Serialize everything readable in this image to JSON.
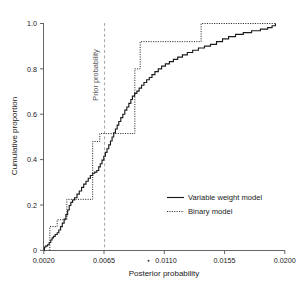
{
  "chart_data": {
    "type": "line",
    "title": "",
    "subtitle": "",
    "xlabel": "Posterior probability",
    "ylabel": "Cumulative proportion",
    "xlim": [
      0.002,
      0.02
    ],
    "ylim": [
      0.0,
      1.0
    ],
    "grid": false,
    "legend_position": "center-right",
    "xticks": [
      "0.0020",
      "0.0065",
      "0.0110",
      "0.0155",
      "0.0200"
    ],
    "xtick_values": [
      0.002,
      0.0065,
      0.011,
      0.0155,
      0.02
    ],
    "yticks": [
      "0",
      "0.2",
      "0.4",
      "0.6",
      "0.8",
      "1.0"
    ],
    "ytick_values": [
      0,
      0.2,
      0.4,
      0.6,
      0.8,
      1.0
    ],
    "annotations": [
      {
        "name": "prior-probability-line",
        "label": "Prior probability",
        "x": 0.00645,
        "orientation": "vertical",
        "style": "dashed",
        "color": "#9a9a9a"
      }
    ],
    "series": [
      {
        "name": "Variable weight model",
        "style": "solid",
        "color": "#1c1c1c",
        "step": "post",
        "points": [
          [
            0.002,
            0.0
          ],
          [
            0.00205,
            0.015
          ],
          [
            0.00215,
            0.02
          ],
          [
            0.00228,
            0.025
          ],
          [
            0.0024,
            0.035
          ],
          [
            0.00252,
            0.046
          ],
          [
            0.00262,
            0.055
          ],
          [
            0.00272,
            0.062
          ],
          [
            0.00285,
            0.07
          ],
          [
            0.003,
            0.078
          ],
          [
            0.00312,
            0.09
          ],
          [
            0.00325,
            0.105
          ],
          [
            0.00338,
            0.12
          ],
          [
            0.00352,
            0.138
          ],
          [
            0.00365,
            0.158
          ],
          [
            0.00378,
            0.178
          ],
          [
            0.0039,
            0.198
          ],
          [
            0.00402,
            0.212
          ],
          [
            0.00415,
            0.222
          ],
          [
            0.0043,
            0.232
          ],
          [
            0.00448,
            0.248
          ],
          [
            0.00465,
            0.262
          ],
          [
            0.00482,
            0.278
          ],
          [
            0.00498,
            0.292
          ],
          [
            0.00515,
            0.305
          ],
          [
            0.00532,
            0.318
          ],
          [
            0.00548,
            0.33
          ],
          [
            0.00565,
            0.34
          ],
          [
            0.0058,
            0.345
          ],
          [
            0.00596,
            0.352
          ],
          [
            0.0061,
            0.368
          ],
          [
            0.00622,
            0.382
          ],
          [
            0.00635,
            0.398
          ],
          [
            0.00648,
            0.415
          ],
          [
            0.0066,
            0.432
          ],
          [
            0.00672,
            0.448
          ],
          [
            0.00685,
            0.465
          ],
          [
            0.00698,
            0.482
          ],
          [
            0.0071,
            0.5
          ],
          [
            0.00722,
            0.518
          ],
          [
            0.00735,
            0.535
          ],
          [
            0.00748,
            0.552
          ],
          [
            0.0076,
            0.568
          ],
          [
            0.00775,
            0.585
          ],
          [
            0.0079,
            0.6
          ],
          [
            0.00805,
            0.618
          ],
          [
            0.0082,
            0.632
          ],
          [
            0.00835,
            0.648
          ],
          [
            0.0085,
            0.665
          ],
          [
            0.00862,
            0.68
          ],
          [
            0.00878,
            0.692
          ],
          [
            0.00895,
            0.702
          ],
          [
            0.00912,
            0.715
          ],
          [
            0.0093,
            0.728
          ],
          [
            0.00948,
            0.74
          ],
          [
            0.00968,
            0.752
          ],
          [
            0.00988,
            0.762
          ],
          [
            0.01008,
            0.775
          ],
          [
            0.0103,
            0.788
          ],
          [
            0.01055,
            0.8
          ],
          [
            0.0108,
            0.812
          ],
          [
            0.01108,
            0.822
          ],
          [
            0.01138,
            0.832
          ],
          [
            0.01168,
            0.842
          ],
          [
            0.012,
            0.852
          ],
          [
            0.01235,
            0.862
          ],
          [
            0.01272,
            0.872
          ],
          [
            0.01312,
            0.882
          ],
          [
            0.01355,
            0.892
          ],
          [
            0.014,
            0.9
          ],
          [
            0.01445,
            0.908
          ],
          [
            0.0149,
            0.92
          ],
          [
            0.01535,
            0.932
          ],
          [
            0.0158,
            0.942
          ],
          [
            0.01632,
            0.952
          ],
          [
            0.0169,
            0.96
          ],
          [
            0.01752,
            0.968
          ],
          [
            0.01818,
            0.975
          ],
          [
            0.01872,
            0.982
          ],
          [
            0.01905,
            0.99
          ],
          [
            0.0193,
            1.0
          ]
        ]
      },
      {
        "name": "Binary model",
        "style": "dotted",
        "color": "#2a2a2a",
        "step": "post",
        "points": [
          [
            0.00245,
            0.0
          ],
          [
            0.00245,
            0.105
          ],
          [
            0.003,
            0.105
          ],
          [
            0.003,
            0.135
          ],
          [
            0.00372,
            0.135
          ],
          [
            0.00372,
            0.225
          ],
          [
            0.00565,
            0.225
          ],
          [
            0.00565,
            0.48
          ],
          [
            0.00618,
            0.48
          ],
          [
            0.00618,
            0.515
          ],
          [
            0.0088,
            0.515
          ],
          [
            0.0088,
            0.8
          ],
          [
            0.0092,
            0.8
          ],
          [
            0.0092,
            0.92
          ],
          [
            0.01375,
            0.92
          ],
          [
            0.01375,
            1.0
          ],
          [
            0.0193,
            1.0
          ]
        ]
      }
    ]
  },
  "axis": {
    "x_label": "Posterior probability",
    "y_label": "Cumulative proportion"
  },
  "legend": {
    "entries": [
      {
        "label": "Variable weight model",
        "style": "solid"
      },
      {
        "label": "Binary model",
        "style": "dotted"
      }
    ]
  },
  "annotation": {
    "prior_probability_label": "Prior probability"
  }
}
